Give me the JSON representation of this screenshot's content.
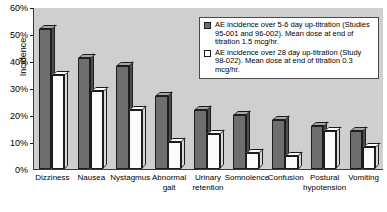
{
  "chart_data": {
    "type": "bar",
    "title": "",
    "xlabel": "",
    "ylabel": "Incidence",
    "ylim": [
      0,
      60
    ],
    "ytick_labels": [
      "60%",
      "50%",
      "40%",
      "30%",
      "20%",
      "10%",
      "0%"
    ],
    "ytick_values": [
      60,
      50,
      40,
      30,
      20,
      10,
      0
    ],
    "grid": false,
    "legend_position": "top-right",
    "categories": [
      "Dizziness",
      "Nausea",
      "Nystagmus",
      "Abnormal\ngait",
      "Urinary\nretention",
      "Somnolence",
      "Confusion",
      "Postural\nhypotension",
      "Vomiting"
    ],
    "series": [
      {
        "name": "AE incidence over 5-6 day up-titration (Studies 95-001 and 96-002). Mean dose at end of titration 1.5 mcg/hr.",
        "color": "#6e6e6e",
        "values": [
          52,
          41,
          38,
          27,
          22,
          20,
          18,
          16,
          14
        ]
      },
      {
        "name": "AE incidence over 28 day up-titration (Study 98-022). Mean dose at end of titration 0.3 mcg/hr.",
        "color": "#ffffff",
        "values": [
          35,
          29,
          22,
          10,
          13,
          6,
          5,
          14,
          8
        ]
      }
    ]
  },
  "legend": {
    "entries": [
      {
        "swatch": "dark",
        "text": "AE incidence over 5-6 day up-titration (Studies 95-001 and 96-002). Mean dose at end of titration 1.5 mcg/hr."
      },
      {
        "swatch": "light",
        "text": "AE incidence over 28 day up-titration (Study 98-022). Mean dose at end of titration 0.3 mcg/hr."
      }
    ]
  }
}
